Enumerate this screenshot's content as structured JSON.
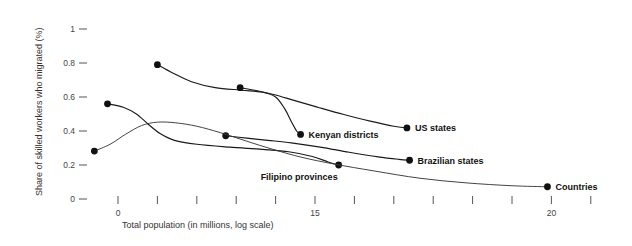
{
  "chart_data": {
    "type": "line",
    "title": "",
    "subtitle": "",
    "xlabel": "Total population (in millions, log scale)",
    "ylabel": "Share of skilled workers who migrated (%)",
    "xlim": [
      -2.0,
      23.5
    ],
    "ylim": [
      0,
      1.08
    ],
    "grid": false,
    "legend_position": "inline-endpoint-labels",
    "x_ticks": [
      {
        "value": 0,
        "label": "0"
      },
      {
        "value": 3,
        "label": ""
      },
      {
        "value": 6,
        "label": ""
      },
      {
        "value": 9,
        "label": ""
      },
      {
        "value": 12,
        "label": ""
      },
      {
        "value": 15,
        "label": "15"
      },
      {
        "value": 18,
        "label": ""
      },
      {
        "value": 21,
        "label": ""
      },
      {
        "value": 24,
        "label": ""
      },
      {
        "value": 27,
        "label": ""
      },
      {
        "value": 30,
        "label": ""
      },
      {
        "value": 33,
        "label": "20"
      },
      {
        "value": 36,
        "label": ""
      }
    ],
    "y_ticks": [
      {
        "value": 0,
        "label": "0"
      },
      {
        "value": 0.2,
        "label": "0.2"
      },
      {
        "value": 0.4,
        "label": "0.4"
      },
      {
        "value": 0.6,
        "label": "0.6"
      },
      {
        "value": 0.8,
        "label": "0.8"
      },
      {
        "value": 1.0,
        "label": "1"
      }
    ],
    "series": [
      {
        "name": "Kenyan districts",
        "label": "Kenyan districts",
        "color": "#1a1a1a",
        "start_marker": true,
        "end_marker": true,
        "points": [
          {
            "x": 3.0,
            "y": 0.79
          },
          {
            "x": 4.2,
            "y": 0.74
          },
          {
            "x": 5.6,
            "y": 0.69
          },
          {
            "x": 7.4,
            "y": 0.655
          },
          {
            "x": 9.4,
            "y": 0.64
          },
          {
            "x": 11.0,
            "y": 0.628
          },
          {
            "x": 12.0,
            "y": 0.6
          },
          {
            "x": 12.7,
            "y": 0.53
          },
          {
            "x": 13.2,
            "y": 0.455
          },
          {
            "x": 13.6,
            "y": 0.4
          },
          {
            "x": 13.9,
            "y": 0.38
          }
        ]
      },
      {
        "name": "US states",
        "label": "US states",
        "color": "#1a1a1a",
        "start_marker": true,
        "end_marker": true,
        "points": [
          {
            "x": 9.3,
            "y": 0.655
          },
          {
            "x": 10.6,
            "y": 0.637
          },
          {
            "x": 12.0,
            "y": 0.612
          },
          {
            "x": 13.4,
            "y": 0.58
          },
          {
            "x": 15.2,
            "y": 0.54
          },
          {
            "x": 17.2,
            "y": 0.497
          },
          {
            "x": 19.2,
            "y": 0.458
          },
          {
            "x": 21.0,
            "y": 0.428
          },
          {
            "x": 22.0,
            "y": 0.418
          }
        ]
      },
      {
        "name": "Filipino provinces",
        "label": "Filipino provinces",
        "color": "#1a1a1a",
        "start_marker": true,
        "end_marker": true,
        "points": [
          {
            "x": -0.8,
            "y": 0.56
          },
          {
            "x": 0.4,
            "y": 0.54
          },
          {
            "x": 1.4,
            "y": 0.5
          },
          {
            "x": 2.3,
            "y": 0.44
          },
          {
            "x": 3.2,
            "y": 0.385
          },
          {
            "x": 4.3,
            "y": 0.345
          },
          {
            "x": 6.0,
            "y": 0.322
          },
          {
            "x": 8.5,
            "y": 0.305
          },
          {
            "x": 11.0,
            "y": 0.292
          },
          {
            "x": 13.0,
            "y": 0.278
          },
          {
            "x": 14.8,
            "y": 0.25
          },
          {
            "x": 16.0,
            "y": 0.218
          },
          {
            "x": 16.8,
            "y": 0.2
          }
        ]
      },
      {
        "name": "Brazilian states",
        "label": "Brazilian states",
        "color": "#1a1a1a",
        "start_marker": true,
        "end_marker": true,
        "points": [
          {
            "x": 8.2,
            "y": 0.372
          },
          {
            "x": 9.8,
            "y": 0.358
          },
          {
            "x": 11.4,
            "y": 0.345
          },
          {
            "x": 13.2,
            "y": 0.33
          },
          {
            "x": 15.4,
            "y": 0.305
          },
          {
            "x": 17.6,
            "y": 0.275
          },
          {
            "x": 19.8,
            "y": 0.248
          },
          {
            "x": 21.4,
            "y": 0.233
          },
          {
            "x": 22.2,
            "y": 0.228
          }
        ]
      },
      {
        "name": "Countries",
        "label": "Countries",
        "color": "#3a3a3a",
        "start_marker": true,
        "end_marker": true,
        "points": [
          {
            "x": -1.8,
            "y": 0.282
          },
          {
            "x": -0.6,
            "y": 0.322
          },
          {
            "x": 0.6,
            "y": 0.382
          },
          {
            "x": 1.8,
            "y": 0.432
          },
          {
            "x": 3.0,
            "y": 0.452
          },
          {
            "x": 4.4,
            "y": 0.448
          },
          {
            "x": 6.0,
            "y": 0.428
          },
          {
            "x": 7.8,
            "y": 0.39
          },
          {
            "x": 9.8,
            "y": 0.34
          },
          {
            "x": 11.8,
            "y": 0.292
          },
          {
            "x": 14.0,
            "y": 0.245
          },
          {
            "x": 16.5,
            "y": 0.205
          },
          {
            "x": 19.5,
            "y": 0.165
          },
          {
            "x": 23.0,
            "y": 0.122
          },
          {
            "x": 26.5,
            "y": 0.095
          },
          {
            "x": 30.0,
            "y": 0.078
          },
          {
            "x": 32.7,
            "y": 0.072
          }
        ]
      }
    ]
  }
}
